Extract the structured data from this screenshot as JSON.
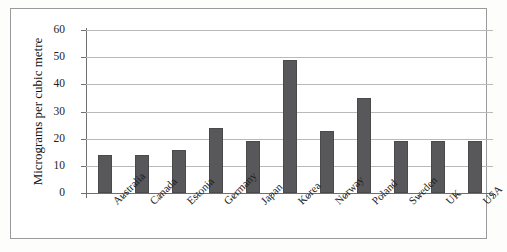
{
  "chart_data": {
    "type": "bar",
    "title": "",
    "xlabel": "",
    "ylabel": "Micrograms per cubic metre",
    "categories": [
      "Australia",
      "Canada",
      "Estonia",
      "Germany",
      "Japan",
      "Korea",
      "Norway",
      "Poland",
      "Sweden",
      "UK",
      "USA"
    ],
    "values": [
      14,
      14,
      16,
      24,
      19,
      49,
      23,
      35,
      19,
      19,
      19
    ],
    "ylim": [
      0,
      60
    ],
    "yticks": [
      0,
      10,
      20,
      30,
      40,
      50,
      60
    ],
    "ytick_labels": [
      "0",
      "10",
      "20",
      "30",
      "40",
      "50",
      "60"
    ],
    "grid": true,
    "legend": "none",
    "bar_color": "#58585a",
    "gridline_color": "#b9b9b9",
    "axis_color": "#6f6f6f",
    "frame_color": "#9a9a9a",
    "background": "#ffffff"
  }
}
